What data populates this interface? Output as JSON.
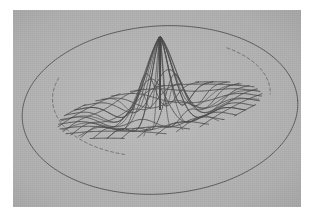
{
  "figure": {
    "kind": "3d-wireframe-mesh-surface-plot",
    "caption": "",
    "background_color": "#ffffff",
    "plot_background_color": "#b7b7b7",
    "line_color": "#3b3b3b",
    "hidden_line_color": "#5a5a5a",
    "line_width": 0.9,
    "plot_box": {
      "x": 13,
      "y": 10,
      "width": 288,
      "height": 197
    }
  },
  "chart_data": {
    "type": "line",
    "title": "",
    "subtitle": "",
    "xlabel": "",
    "ylabel": "",
    "zlabel": "",
    "grid": false,
    "legend": null,
    "annotations": [],
    "surface": {
      "description": "radially symmetric oscillating ripple surface (sinc-like) with a singular convergence point at the parameter origin",
      "singularity_point": {
        "x": 147,
        "y": 100
      },
      "silhouette": {
        "shape": "ellipse",
        "center": {
          "x": 147,
          "y": 100
        },
        "rx": 138,
        "ry": 84,
        "rotation_deg": -4
      },
      "u_curve_count": 13,
      "v_curve_count": 13,
      "radial_ray_count": 8,
      "peak_height_px": 74,
      "valley_depth_px": 74,
      "ripple_periods": 3.0,
      "decay": 0.55
    },
    "camera": {
      "azimuth_deg": -37,
      "elevation_deg": 24,
      "projection": "oblique",
      "x_axis_screen": {
        "dx": 1.0,
        "dy": 0.0
      },
      "y_axis_screen": {
        "dx": -0.62,
        "dy": 0.52
      }
    },
    "axis_ranges": {
      "u": [
        -3.0,
        3.0
      ],
      "v": [
        -3.0,
        3.0
      ],
      "z": [
        -1.0,
        1.0
      ]
    }
  }
}
